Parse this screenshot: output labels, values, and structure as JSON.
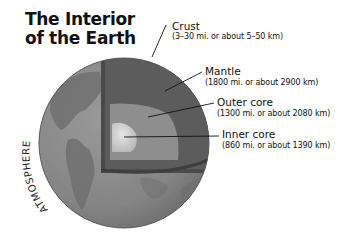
{
  "title": {
    "line1": "The Interior",
    "line2": "of the Earth"
  },
  "atmosphere_label": "ATMOSPHERE",
  "layers": [
    {
      "name": "Crust",
      "thickness": "(3–30 mi. or about 5–50 km)"
    },
    {
      "name": "Mantle",
      "thickness": "(1800 mi. or about 2900 km)"
    },
    {
      "name": "Outer core",
      "thickness": "(1300 mi. or about 2080 km)"
    },
    {
      "name": "Inner core",
      "thickness": "(860 mi. or about 1390 km)"
    }
  ],
  "colors": {
    "surface": "#8a8a8a",
    "land": "#6e6e6e",
    "crust": "#4a4a4a",
    "mantle": "#5c5c5c",
    "outer_core": "#8e8e8e",
    "inner_core": "#cfcfcf"
  }
}
